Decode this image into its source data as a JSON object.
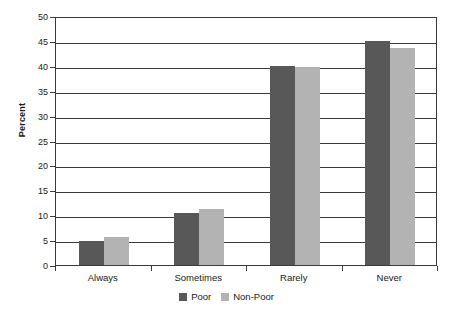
{
  "chart_data": {
    "type": "bar",
    "title": "",
    "subtitle": "",
    "xlabel": "",
    "ylabel": "Percent",
    "categories": [
      "Always",
      "Sometimes",
      "Rarely",
      "Never"
    ],
    "series": [
      {
        "name": "Poor",
        "color": "#585858",
        "values": [
          4.8,
          10.5,
          40.0,
          45.0
        ]
      },
      {
        "name": "Non-Poor",
        "color": "#b3b3b3",
        "values": [
          5.7,
          11.3,
          39.7,
          43.5
        ]
      }
    ],
    "ylim": [
      0,
      50
    ],
    "ytick_step": 5,
    "ytick_labels": [
      "0",
      "5",
      "10",
      "15",
      "20",
      "25",
      "30",
      "35",
      "40",
      "45",
      "50"
    ],
    "grid": true,
    "legend_position": "bottom"
  },
  "axis": {
    "y_title": "Percent"
  },
  "legend": {
    "entries": [
      {
        "label": "Poor"
      },
      {
        "label": "Non-Poor"
      }
    ]
  }
}
